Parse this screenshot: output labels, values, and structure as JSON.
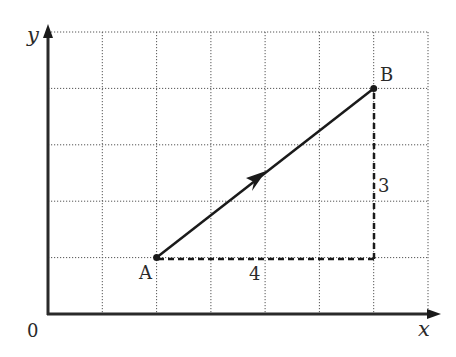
{
  "diagram": {
    "type": "vector-on-grid",
    "axes": {
      "x_label": "x",
      "y_label": "y",
      "origin_label": "0"
    },
    "grid": {
      "columns": 7,
      "rows": 5,
      "style": "dotted"
    },
    "points": [
      {
        "name": "A",
        "grid_x": 2,
        "grid_y": 1
      },
      {
        "name": "B",
        "grid_x": 6,
        "grid_y": 4
      }
    ],
    "vector": {
      "from": "A",
      "to": "B",
      "style": "solid-with-midpoint-arrow"
    },
    "components": [
      {
        "label": "4",
        "direction": "horizontal",
        "style": "dashed"
      },
      {
        "label": "3",
        "direction": "vertical",
        "style": "dashed"
      }
    ],
    "colors": {
      "ink": "#1a1a1a",
      "grid": "#555555",
      "background": "#ffffff"
    }
  }
}
